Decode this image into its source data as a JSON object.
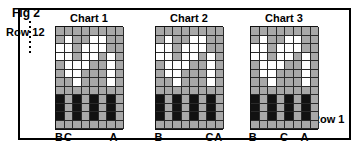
{
  "figure": {
    "fig_label": "Fig 2",
    "row_top_label": "Row 12",
    "row_bottom_label": "Row 1",
    "background_color": "#ffffff",
    "frame_color": "#000000",
    "gray_color": "#a8a8a8",
    "black_color": "#121212",
    "white_color": "#ffffff"
  },
  "chart_data": {
    "type": "heatmap",
    "title": "Fig 2",
    "xlabel": "",
    "ylabel": "Row",
    "grid": true,
    "legend": "none",
    "rows": 12,
    "row_tick_labels": [
      "Row 12",
      "Row 1"
    ],
    "columns": 8,
    "cell_states": [
      "g",
      "w",
      "k",
      "b"
    ],
    "cell_state_meaning": {
      "g": "gray-filled cell",
      "w": "white empty cell",
      "k": "black background cell",
      "b": "gray bar segment on black background"
    },
    "charts": [
      {
        "title": "Chart 1",
        "columns": 8,
        "rows": 12,
        "matrix": [
          [
            "g",
            "g",
            "g",
            "g",
            "g",
            "g",
            "g",
            "g"
          ],
          [
            "g",
            "w",
            "g",
            "g",
            "w",
            "w",
            "g",
            "g"
          ],
          [
            "w",
            "w",
            "g",
            "w",
            "w",
            "w",
            "g",
            "g"
          ],
          [
            "w",
            "w",
            "g",
            "w",
            "w",
            "g",
            "w",
            "g"
          ],
          [
            "g",
            "w",
            "w",
            "w",
            "g",
            "g",
            "w",
            "g"
          ],
          [
            "g",
            "w",
            "w",
            "g",
            "g",
            "g",
            "w",
            "g"
          ],
          [
            "g",
            "g",
            "w",
            "g",
            "g",
            "g",
            "w",
            "g"
          ],
          [
            "g",
            "g",
            "g",
            "g",
            "g",
            "g",
            "g",
            "g"
          ],
          [
            "k",
            "b",
            "k",
            "b",
            "k",
            "b",
            "k",
            "b"
          ],
          [
            "k",
            "b",
            "k",
            "b",
            "k",
            "b",
            "k",
            "b"
          ],
          [
            "k",
            "b",
            "k",
            "b",
            "k",
            "b",
            "k",
            "b"
          ],
          [
            "g",
            "g",
            "g",
            "g",
            "g",
            "g",
            "g",
            "g"
          ]
        ],
        "axis_labels": [
          {
            "text": "B",
            "position_pct": 6
          },
          {
            "text": "C",
            "position_pct": 19
          },
          {
            "text": "A",
            "position_pct": 86
          }
        ]
      },
      {
        "title": "Chart 2",
        "columns": 8,
        "rows": 12,
        "matrix": [
          [
            "g",
            "g",
            "g",
            "g",
            "g",
            "g",
            "g",
            "g"
          ],
          [
            "g",
            "w",
            "g",
            "g",
            "w",
            "w",
            "g",
            "g"
          ],
          [
            "w",
            "w",
            "g",
            "w",
            "w",
            "w",
            "g",
            "g"
          ],
          [
            "w",
            "w",
            "g",
            "w",
            "w",
            "g",
            "w",
            "g"
          ],
          [
            "g",
            "w",
            "w",
            "w",
            "g",
            "g",
            "w",
            "g"
          ],
          [
            "g",
            "w",
            "w",
            "g",
            "g",
            "g",
            "w",
            "g"
          ],
          [
            "g",
            "g",
            "w",
            "g",
            "g",
            "g",
            "w",
            "g"
          ],
          [
            "g",
            "g",
            "g",
            "g",
            "g",
            "g",
            "g",
            "g"
          ],
          [
            "k",
            "b",
            "k",
            "b",
            "k",
            "b",
            "k",
            "b"
          ],
          [
            "k",
            "b",
            "k",
            "b",
            "k",
            "b",
            "k",
            "b"
          ],
          [
            "k",
            "b",
            "k",
            "b",
            "k",
            "b",
            "k",
            "b"
          ],
          [
            "g",
            "g",
            "g",
            "g",
            "g",
            "g",
            "g",
            "g"
          ]
        ],
        "axis_labels": [
          {
            "text": "B",
            "position_pct": 5
          },
          {
            "text": "C",
            "position_pct": 80
          },
          {
            "text": "A",
            "position_pct": 93
          }
        ]
      },
      {
        "title": "Chart 3",
        "columns": 8,
        "rows": 12,
        "matrix": [
          [
            "g",
            "g",
            "g",
            "g",
            "g",
            "g",
            "g",
            "g"
          ],
          [
            "g",
            "w",
            "g",
            "g",
            "w",
            "w",
            "g",
            "g"
          ],
          [
            "w",
            "w",
            "g",
            "w",
            "w",
            "w",
            "g",
            "g"
          ],
          [
            "w",
            "w",
            "g",
            "w",
            "w",
            "g",
            "w",
            "g"
          ],
          [
            "g",
            "w",
            "w",
            "w",
            "g",
            "g",
            "w",
            "g"
          ],
          [
            "g",
            "w",
            "w",
            "g",
            "g",
            "g",
            "w",
            "g"
          ],
          [
            "g",
            "g",
            "w",
            "g",
            "g",
            "g",
            "w",
            "g"
          ],
          [
            "g",
            "g",
            "g",
            "g",
            "g",
            "g",
            "g",
            "g"
          ],
          [
            "k",
            "b",
            "k",
            "b",
            "k",
            "b",
            "k",
            "b"
          ],
          [
            "k",
            "b",
            "k",
            "b",
            "k",
            "b",
            "k",
            "b"
          ],
          [
            "k",
            "b",
            "k",
            "b",
            "k",
            "b",
            "k",
            "b"
          ],
          [
            "g",
            "g",
            "g",
            "g",
            "g",
            "g",
            "g",
            "g"
          ]
        ],
        "axis_labels": [
          {
            "text": "B",
            "position_pct": 4
          },
          {
            "text": "C",
            "position_pct": 50
          },
          {
            "text": "A",
            "position_pct": 80
          }
        ]
      }
    ]
  },
  "layout": {
    "chart_left_offsets": [
      55,
      155,
      250
    ],
    "chart_width": 68,
    "cell_size": 8.5
  }
}
